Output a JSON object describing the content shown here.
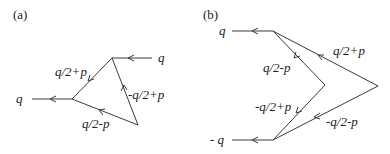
{
  "panels": [
    {
      "id": "a",
      "tag": "(a)",
      "external": {
        "left": "q",
        "right": "q"
      },
      "internal": {
        "top_edge": "q/2+p",
        "right_edge": "-q/2+p",
        "bottom_edge": "q/2-p"
      }
    },
    {
      "id": "b",
      "tag": "(b)",
      "external": {
        "top": "q",
        "bottom": "- q"
      },
      "internal": {
        "outer_top": "q/2+p",
        "inner_top": "q/2-p",
        "inner_bottom": "-q/2+p",
        "outer_bottom": "-q/2-p"
      }
    }
  ]
}
